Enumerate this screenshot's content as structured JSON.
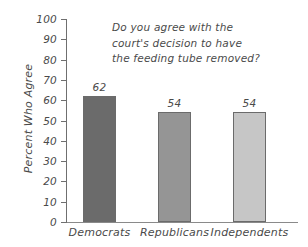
{
  "chart_data": {
    "type": "bar",
    "title": "Do you agree with the\ncourt's decision to have\nthe feeding tube removed?",
    "title_lines": [
      "Do you agree with the",
      "court's decision to have",
      "the feeding tube removed?"
    ],
    "xlabel": "",
    "ylabel": "Percent Who Agree",
    "categories": [
      "Democrats",
      "Republicans",
      "Independents"
    ],
    "values": [
      62,
      54,
      54
    ],
    "value_labels": [
      "62",
      "54",
      "54"
    ],
    "bar_colors": [
      "#6b6b6b",
      "#959595",
      "#c6c6c6"
    ],
    "ylim": [
      0,
      100
    ],
    "ytick_step": 10,
    "ytick_labels": [
      "100",
      "90",
      "80",
      "70",
      "60",
      "50",
      "40",
      "30",
      "20",
      "10",
      "0"
    ],
    "ytick_values": [
      100,
      90,
      80,
      70,
      60,
      50,
      40,
      30,
      20,
      10,
      0
    ],
    "grid": false,
    "legend": "none",
    "axis_color": "#6f6f6f",
    "text_color": "#4a4a4a",
    "background_color": "#ffffff"
  }
}
